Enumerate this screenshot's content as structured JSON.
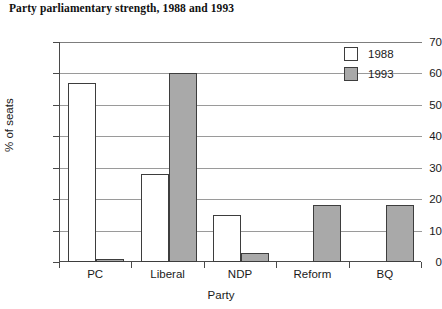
{
  "chart_data": {
    "type": "bar",
    "title": "Party parliamentary strength, 1988 and 1993",
    "xlabel": "Party",
    "ylabel": "% of seats",
    "categories": [
      "PC",
      "Liberal",
      "NDP",
      "Reform",
      "BQ"
    ],
    "series": [
      {
        "name": "1988",
        "color": "#ffffff",
        "values": [
          57,
          28,
          15,
          0,
          0
        ]
      },
      {
        "name": "1993",
        "color": "#a9a9a9",
        "values": [
          1,
          60,
          3,
          18,
          18
        ]
      }
    ],
    "ylim": [
      0,
      70
    ],
    "ytick_labels": [
      "70",
      "60",
      "50",
      "40",
      "30",
      "20",
      "10",
      "0"
    ],
    "ytick_values": [
      70,
      60,
      50,
      40,
      30,
      20,
      10,
      0
    ],
    "grid": "horizontal",
    "legend_position": "top-right"
  }
}
